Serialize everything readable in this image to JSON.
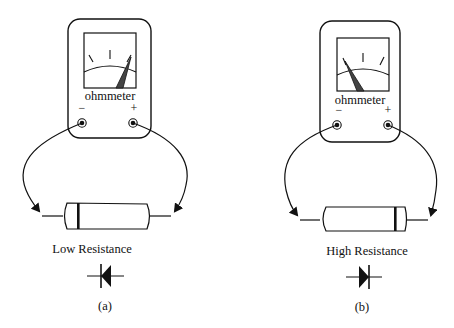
{
  "diagram": {
    "type": "ohmmeter diode test",
    "colors": {
      "ink": "#111111",
      "background": "#ffffff",
      "needle": "#333333"
    },
    "panels": [
      {
        "id": "a",
        "meter_label": "ohmmeter",
        "terminal_minus": "−",
        "terminal_plus": "+",
        "needle_position": "right",
        "result_label": "Low Resistance",
        "diode_symbol_direction": "pointing-left",
        "caption": "(a)"
      },
      {
        "id": "b",
        "meter_label": "ohmmeter",
        "terminal_minus": "−",
        "terminal_plus": "+",
        "needle_position": "left",
        "result_label": "High Resistance",
        "diode_symbol_direction": "pointing-right",
        "caption": "(b)"
      }
    ]
  }
}
